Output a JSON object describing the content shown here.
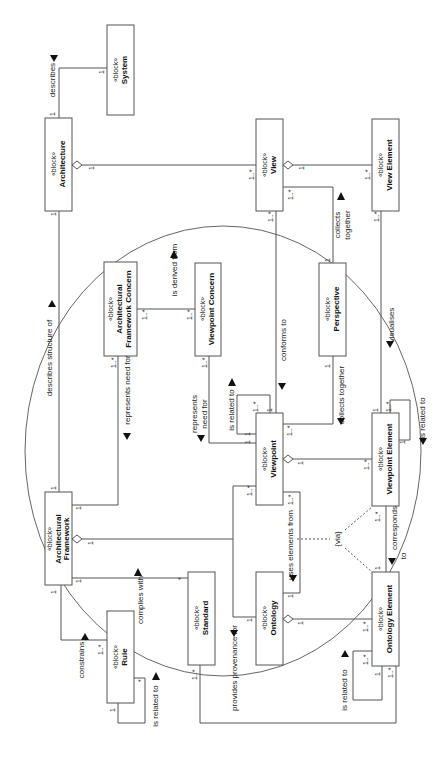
{
  "diagram": {
    "stereotype": "«block»",
    "blocks": {
      "system": {
        "name": "System"
      },
      "architecture": {
        "name": "Architecture"
      },
      "view": {
        "name": "View"
      },
      "view_element": {
        "name": "View Element"
      },
      "arch_fw_concern": {
        "name_line1": "Architectural",
        "name_line2": "Framework Concern"
      },
      "viewpoint_concern": {
        "name": "Viewpoint Concern"
      },
      "perspective": {
        "name": "Perspective"
      },
      "viewpoint": {
        "name": "Viewpoint"
      },
      "viewpoint_element": {
        "name": "Viewpoint Element"
      },
      "arch_framework": {
        "name_line1": "Architectural",
        "name_line2": "Framework"
      },
      "standard": {
        "name": "Standard"
      },
      "ontology": {
        "name": "Ontology"
      },
      "ontology_element": {
        "name": "Ontology Element"
      },
      "rule": {
        "name": "Rule"
      }
    },
    "relations": {
      "describes": "describes",
      "describes_structure_of": "describes structure of",
      "represents_need_for": "represents need for",
      "is_derived_from": "is derived from",
      "conforms_to": "conforms to",
      "collects_together_1": "collects",
      "collects_together_2": "together",
      "collects_together_vp": "collects together",
      "visualises": "visualises",
      "represents_need_for_vp_1": "represents",
      "represents_need_for_vp_2": "need for",
      "vp_is_related_to": "is related to",
      "vpe_is_related_to": "is related to",
      "uses_elements_from": "uses elements from",
      "via": "{via}",
      "corresponds_to_1": "corresponds",
      "corresponds_to_2": "to",
      "complies_with": "complies with",
      "constrains": "constrains",
      "rule_is_related_to": "is related to",
      "provides_provenance_for": "provides provenance for",
      "oe_is_related_to": "is related to"
    },
    "multiplicities": {
      "one": "1",
      "one_many": "1..*",
      "many": "*"
    }
  }
}
